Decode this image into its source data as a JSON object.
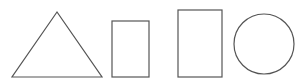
{
  "diagram": {
    "type": "shapes",
    "stroke_color": "#555555",
    "background": "#ffffff",
    "shapes": [
      {
        "kind": "triangle",
        "points": [
          [
            57,
            12
          ],
          [
            12,
            77
          ],
          [
            102,
            77
          ]
        ]
      },
      {
        "kind": "square",
        "x": 112,
        "y": 21,
        "width": 37,
        "height": 56
      },
      {
        "kind": "rectangle",
        "x": 178,
        "y": 10,
        "width": 44,
        "height": 67
      },
      {
        "kind": "circle",
        "cx": 264,
        "cy": 44,
        "r": 30
      }
    ]
  }
}
